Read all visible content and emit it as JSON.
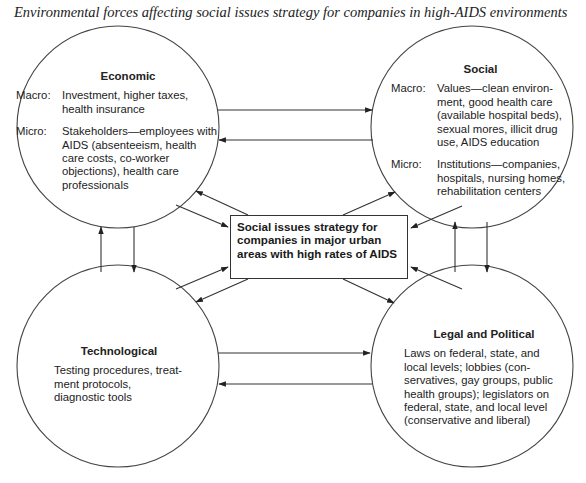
{
  "title": "Environmental forces affecting social issues strategy for companies in high-AIDS environments",
  "nodes": {
    "economic": {
      "heading": "Economic",
      "macro_label": "Macro:",
      "macro_text": "Investment, higher taxes, health insurance",
      "micro_label": "Micro:",
      "micro_text": "Stakeholders—employees with AIDS (absenteeism, health care costs, co-worker objections), health care professionals"
    },
    "social": {
      "heading": "Social",
      "macro_label": "Macro:",
      "macro_text": "Values—clean environ-ment, good health care (available hospital beds), sexual mores, illicit drug use, AIDS education",
      "micro_label": "Micro:",
      "micro_text": "Institutions—companies, hospitals, nursing homes, rehabilitation centers"
    },
    "technological": {
      "heading": "Technological",
      "text": "Testing procedures, treat-ment protocols, diagnostic tools"
    },
    "legal_political": {
      "heading": "Legal and Political",
      "text": "Laws on federal, state, and local levels; lobbies (con-servatives, gay groups, public health groups); legislators on federal, state, and local level (conservative and liberal)"
    },
    "center": {
      "text": "Social issues strategy for companies in major urban areas with high rates of AIDS"
    }
  },
  "edges": [
    {
      "from": "economic",
      "to": "social"
    },
    {
      "from": "social",
      "to": "economic"
    },
    {
      "from": "technological",
      "to": "legal_political"
    },
    {
      "from": "legal_political",
      "to": "technological"
    },
    {
      "from": "technological",
      "to": "economic"
    },
    {
      "from": "economic",
      "to": "technological"
    },
    {
      "from": "legal_political",
      "to": "social"
    },
    {
      "from": "social",
      "to": "legal_political"
    },
    {
      "from": "center",
      "to": "economic"
    },
    {
      "from": "economic",
      "to": "center"
    },
    {
      "from": "center",
      "to": "social"
    },
    {
      "from": "social",
      "to": "center"
    },
    {
      "from": "technological",
      "to": "center"
    },
    {
      "from": "center",
      "to": "technological"
    },
    {
      "from": "legal_political",
      "to": "center"
    },
    {
      "from": "center",
      "to": "legal_political"
    }
  ],
  "colors": {
    "line": "#333333",
    "text": "#222222",
    "background": "#ffffff"
  }
}
